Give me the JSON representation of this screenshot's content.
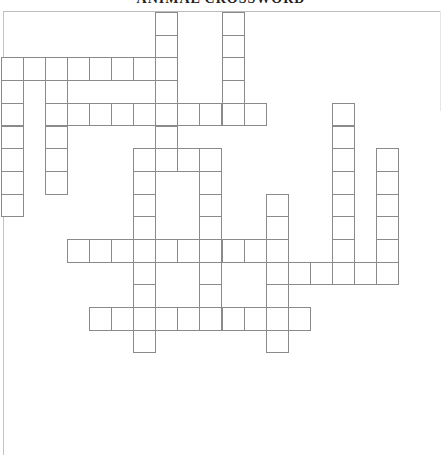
{
  "title": "ANIMAL CROSSWORD",
  "grid": {
    "cell_width": 22.1,
    "cell_height": 22.7,
    "origin_x": 0.5,
    "origin_y": 12,
    "line_color": "#8a8a8a",
    "across": [
      {
        "row": 2,
        "col_start": 0,
        "length": 8
      },
      {
        "row": 4,
        "col_start": 2,
        "length": 10
      },
      {
        "row": 6,
        "col_start": 6,
        "length": 4
      },
      {
        "row": 10,
        "col_start": 3,
        "length": 10
      },
      {
        "row": 11,
        "col_start": 12,
        "length": 6
      },
      {
        "row": 13,
        "col_start": 4,
        "length": 10
      }
    ],
    "down": [
      {
        "col": 0,
        "row_start": 2,
        "length": 7
      },
      {
        "col": 2,
        "row_start": 2,
        "length": 6
      },
      {
        "col": 6,
        "row_start": 6,
        "length": 9
      },
      {
        "col": 7,
        "row_start": 0,
        "length": 7
      },
      {
        "col": 9,
        "row_start": 6,
        "length": 8
      },
      {
        "col": 10,
        "row_start": 0,
        "length": 5
      },
      {
        "col": 12,
        "row_start": 8,
        "length": 7
      },
      {
        "col": 15,
        "row_start": 4,
        "length": 8
      },
      {
        "col": 17,
        "row_start": 6,
        "length": 6
      }
    ]
  }
}
